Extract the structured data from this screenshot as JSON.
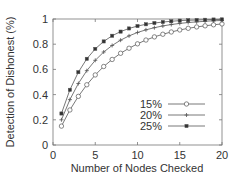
{
  "chart_data": {
    "type": "line",
    "title": "",
    "xlabel": "Number of Nodes Checked",
    "ylabel": "Detection of Dishonest (%)",
    "xlim": [
      0,
      20
    ],
    "ylim": [
      0,
      1
    ],
    "xticks": [
      0,
      5,
      10,
      15,
      20
    ],
    "xtick_labels": [
      "0",
      "5",
      "10",
      "15",
      "20"
    ],
    "yticks": [
      0,
      0.2,
      0.4,
      0.6,
      0.8,
      1
    ],
    "ytick_labels": [
      "0",
      "0.2",
      "0.4",
      "0.6",
      "0.8",
      "1"
    ],
    "grid": false,
    "legend_position": "bottom-right",
    "x": [
      1,
      2,
      3,
      4,
      5,
      6,
      7,
      8,
      9,
      10,
      11,
      12,
      13,
      14,
      15,
      16,
      17,
      18,
      19,
      20
    ],
    "series": [
      {
        "name": "15%",
        "marker": "circle",
        "values": [
          0.15,
          0.278,
          0.386,
          0.478,
          0.556,
          0.623,
          0.679,
          0.728,
          0.768,
          0.803,
          0.833,
          0.858,
          0.879,
          0.897,
          0.913,
          0.926,
          0.937,
          0.946,
          0.954,
          0.961
        ]
      },
      {
        "name": "20%",
        "marker": "plus",
        "values": [
          0.2,
          0.36,
          0.488,
          0.59,
          0.672,
          0.738,
          0.79,
          0.832,
          0.866,
          0.893,
          0.914,
          0.931,
          0.945,
          0.956,
          0.965,
          0.972,
          0.977,
          0.982,
          0.986,
          0.988
        ]
      },
      {
        "name": "25%",
        "marker": "square",
        "values": [
          0.25,
          0.438,
          0.578,
          0.684,
          0.763,
          0.822,
          0.867,
          0.9,
          0.925,
          0.944,
          0.958,
          0.968,
          0.976,
          0.982,
          0.987,
          0.99,
          0.992,
          0.994,
          0.996,
          0.997
        ]
      }
    ]
  }
}
